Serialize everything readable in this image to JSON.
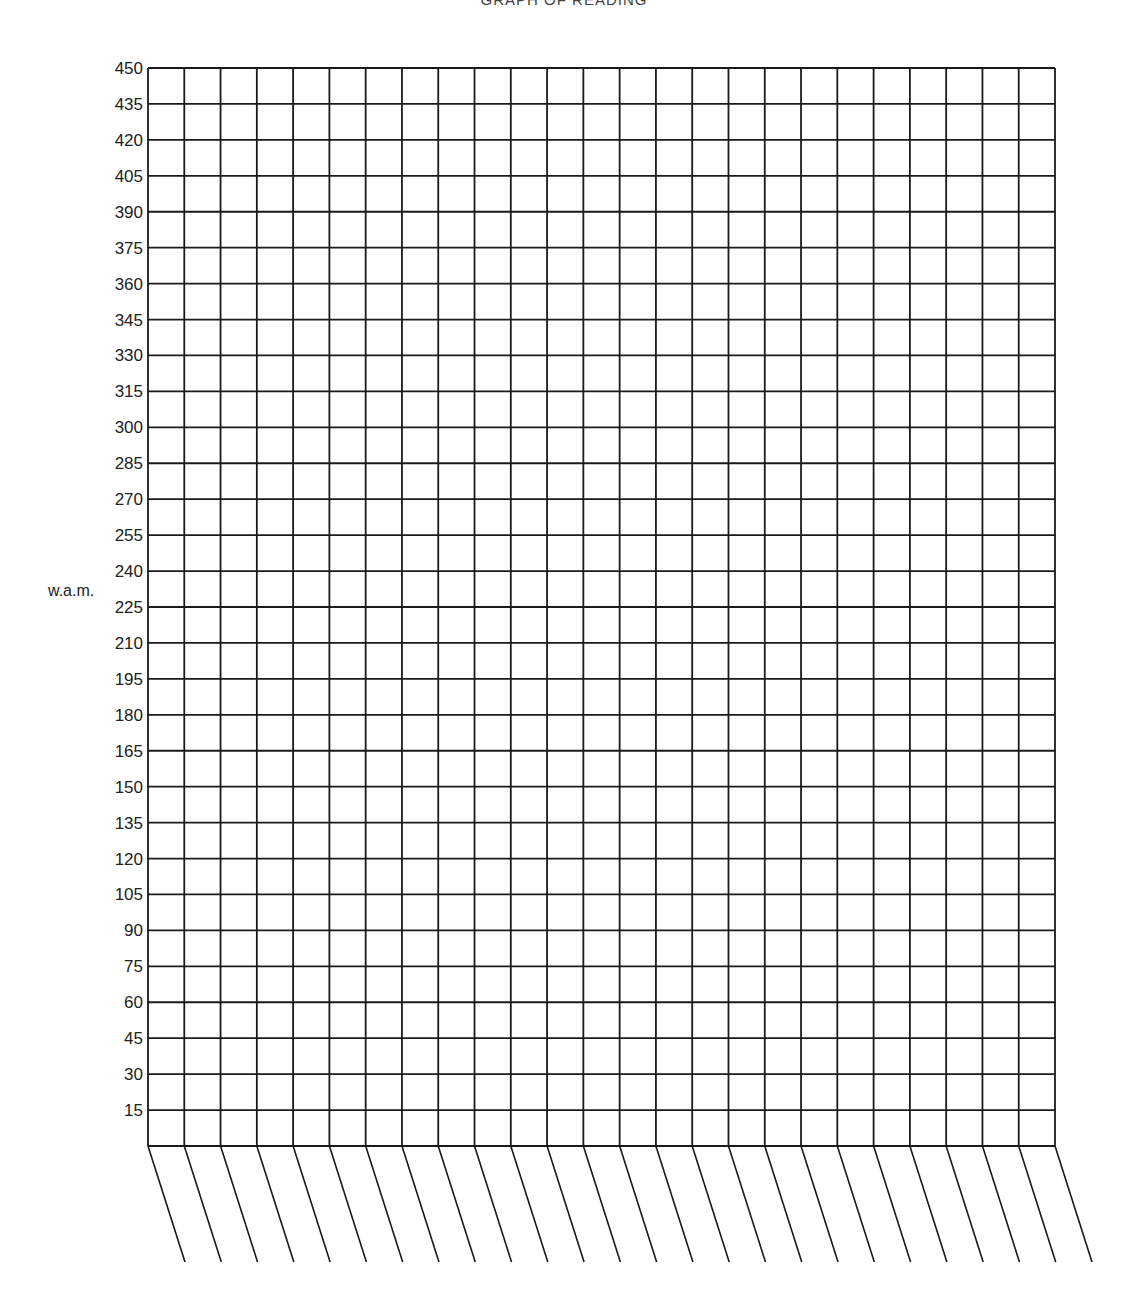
{
  "caption": "GRAPH OF READING",
  "chart_data": {
    "type": "bar",
    "title": "",
    "xlabel": "",
    "ylabel": "w.a.m.",
    "ylim": [
      0,
      450
    ],
    "y_ticks": [
      15,
      30,
      45,
      60,
      75,
      90,
      105,
      120,
      135,
      150,
      165,
      180,
      195,
      210,
      225,
      240,
      255,
      270,
      285,
      300,
      315,
      330,
      345,
      360,
      375,
      390,
      405,
      420,
      435,
      450
    ],
    "columns": 25,
    "categories": [],
    "values": [],
    "grid": true,
    "slanted_label_slots": 26
  }
}
